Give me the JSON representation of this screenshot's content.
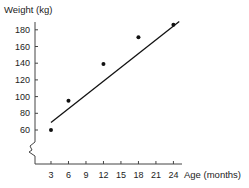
{
  "chart_data": {
    "type": "scatter",
    "title": "",
    "ylabel": "Weight (kg)",
    "xlabel": "Age (months)",
    "x_ticks": [
      3,
      6,
      9,
      12,
      15,
      18,
      21,
      24
    ],
    "y_ticks": [
      60,
      80,
      100,
      120,
      140,
      160,
      180
    ],
    "ylim": [
      50,
      190
    ],
    "xlim": [
      0,
      26
    ],
    "y_axis_break": true,
    "grid": false,
    "legend": null,
    "series": [
      {
        "name": "Observed weight",
        "type": "scatter",
        "points": [
          {
            "x": 3,
            "y": 60
          },
          {
            "x": 6,
            "y": 95
          },
          {
            "x": 12,
            "y": 139
          },
          {
            "x": 18,
            "y": 171
          },
          {
            "x": 24,
            "y": 186
          }
        ]
      },
      {
        "name": "Fitted line",
        "type": "line",
        "points": [
          {
            "x": 3,
            "y": 69
          },
          {
            "x": 25,
            "y": 190
          }
        ]
      }
    ]
  }
}
